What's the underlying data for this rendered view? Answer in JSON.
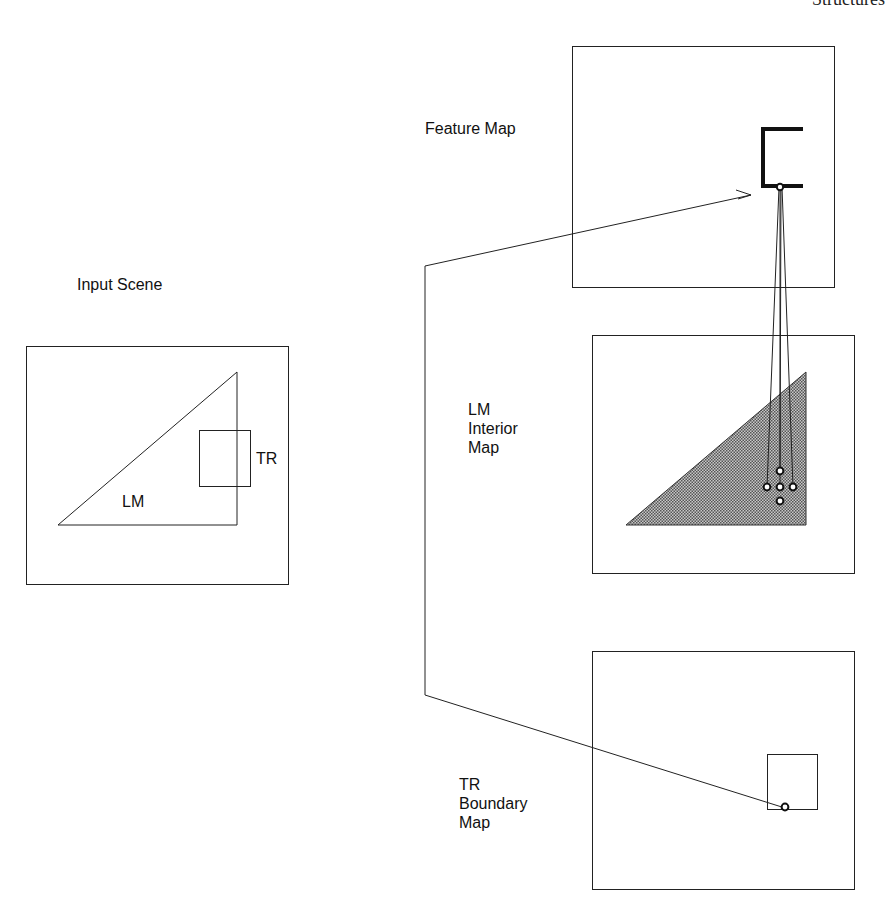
{
  "header": {
    "running_title": "Structures"
  },
  "input_scene": {
    "title": "Input Scene",
    "objects": [
      {
        "id": "LM",
        "label": "LM",
        "shape": "right-triangle"
      },
      {
        "id": "TR",
        "label": "TR",
        "shape": "square"
      }
    ]
  },
  "maps": [
    {
      "id": "feature",
      "title_lines": [
        "Feature Map"
      ],
      "content": "bracket feature with node"
    },
    {
      "id": "lm-interior",
      "title_lines": [
        "LM",
        "Interior",
        "Map"
      ],
      "content": "shaded triangle with 5 nodes"
    },
    {
      "id": "tr-boundary",
      "title_lines": [
        "TR",
        "Boundary",
        "Map"
      ],
      "content": "square outline with boundary node"
    }
  ],
  "connections": [
    {
      "from": "tr-boundary.node",
      "to": "feature.node",
      "arrow": true
    },
    {
      "from": "feature.node",
      "to": "lm-interior.node-left"
    },
    {
      "from": "feature.node",
      "to": "lm-interior.node-center"
    },
    {
      "from": "feature.node",
      "to": "lm-interior.node-top"
    },
    {
      "from": "feature.node",
      "to": "lm-interior.node-right"
    }
  ],
  "colors": {
    "ink": "#111111",
    "shade": "#8a8a8a",
    "paper": "#ffffff"
  }
}
